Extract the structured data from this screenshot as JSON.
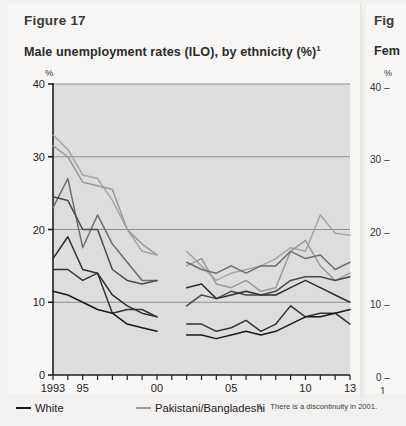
{
  "figure": {
    "label": "Figure 17",
    "title": "Male unemployment rates (ILO), by ethnicity (%)",
    "title_superscript": "1"
  },
  "right_figure": {
    "label": "Fig",
    "title": "Fem",
    "percent_symbol": "%",
    "tick_40": "40 –",
    "tick_30": "30 –",
    "tick_20": "20 –",
    "tick_10": "10 –",
    "tick_0": "0 –",
    "year_partial": "1"
  },
  "legend": {
    "items": [
      {
        "label": "White",
        "color": "#1a1a1a"
      },
      {
        "label": "Pakistani/Bangladeshi",
        "color": "#9a9a9a"
      }
    ]
  },
  "footnote": {
    "number": "1.",
    "text": "There is a discontinuity in 2001."
  },
  "colors": {
    "plot_background": "#dedddb",
    "gridline": "#8e8e8e",
    "axis": "#1f1f1f",
    "page_background": "#f2f1ef",
    "card_background": "#f7f6f4"
  },
  "chart_data": {
    "type": "line",
    "title": "Male unemployment rates (ILO), by ethnicity (%)",
    "xlabel": "",
    "ylabel": "%",
    "ylim": [
      0,
      40
    ],
    "yticks": [
      0,
      10,
      20,
      30,
      40
    ],
    "ytick_labels": [
      "0",
      "10",
      "20",
      "30",
      "40"
    ],
    "xlim": [
      1993,
      2013
    ],
    "xticks": [
      1993,
      1994,
      1995,
      1996,
      1997,
      1998,
      1999,
      2000,
      2001,
      2002,
      2003,
      2004,
      2005,
      2006,
      2007,
      2008,
      2009,
      2010,
      2011,
      2012,
      2013
    ],
    "xtick_labels_shown": {
      "1993": "1993",
      "1995": "95",
      "2000": "00",
      "2005": "05",
      "2010": "10",
      "2013": "13"
    },
    "grid": "horizontal",
    "legend_position": "below",
    "discontinuity_year": 2001,
    "segments": {
      "first": [
        1993,
        1994,
        1995,
        1996,
        1997,
        1998,
        1999,
        2000
      ],
      "second": [
        2002,
        2003,
        2004,
        2005,
        2006,
        2007,
        2008,
        2009,
        2010,
        2011,
        2012,
        2013
      ]
    },
    "series": [
      {
        "name": "Bangladeshi",
        "color": "#a5a5a5",
        "values_first": [
          33.0,
          31.0,
          27.5,
          27.0,
          24.0,
          20.0,
          17.0,
          16.5
        ],
        "values_second": [
          17.0,
          15.0,
          13.0,
          14.0,
          14.5,
          15.0,
          16.0,
          17.5,
          17.0,
          22.0,
          19.5,
          19.2
        ]
      },
      {
        "name": "Pakistani/Bangladeshi",
        "color": "#9a9a9a",
        "values_first": [
          31.5,
          30.0,
          26.5,
          26.0,
          25.5,
          20.0,
          18.0,
          16.5
        ],
        "values_second": [
          15.0,
          16.0,
          12.5,
          12.0,
          13.0,
          11.5,
          12.0,
          17.0,
          18.5,
          15.0,
          13.0,
          14.0
        ]
      },
      {
        "name": "Black",
        "color": "#6e6e6e",
        "values_first": [
          23.0,
          27.0,
          17.5,
          22.0,
          18.0,
          15.5,
          13.0,
          13.0
        ],
        "values_second": [
          15.5,
          14.5,
          14.0,
          15.0,
          14.0,
          15.0,
          15.0,
          17.0,
          16.0,
          16.5,
          14.5,
          15.5
        ]
      },
      {
        "name": "Mixed",
        "color": "#4a4a4a",
        "values_first": [
          24.5,
          24.0,
          20.0,
          20.0,
          14.5,
          13.0,
          12.5,
          13.0
        ],
        "values_second": [
          9.5,
          11.0,
          10.5,
          11.5,
          11.0,
          11.0,
          11.5,
          13.0,
          13.5,
          13.5,
          13.0,
          13.5
        ]
      },
      {
        "name": "Indian",
        "color": "#2e2e2e",
        "values_first": [
          16.0,
          19.0,
          14.5,
          14.0,
          11.0,
          9.5,
          8.5,
          8.0
        ],
        "values_second": [
          12.0,
          12.5,
          10.5,
          11.0,
          11.5,
          11.0,
          11.0,
          12.0,
          13.0,
          12.0,
          11.0,
          10.0
        ]
      },
      {
        "name": "Other",
        "color": "#333333",
        "values_first": [
          14.5,
          14.5,
          13.0,
          14.0,
          8.5,
          9.0,
          9.0,
          8.0
        ],
        "values_second": [
          7.0,
          7.0,
          6.0,
          6.5,
          7.5,
          6.0,
          7.0,
          9.5,
          8.0,
          8.5,
          8.5,
          7.0
        ]
      },
      {
        "name": "White",
        "color": "#1a1a1a",
        "values_first": [
          11.5,
          11.0,
          10.0,
          9.0,
          8.5,
          7.0,
          6.5,
          6.0
        ],
        "values_second": [
          5.5,
          5.5,
          5.0,
          5.5,
          6.0,
          5.5,
          6.0,
          7.0,
          8.0,
          8.0,
          8.5,
          9.0
        ]
      }
    ]
  }
}
